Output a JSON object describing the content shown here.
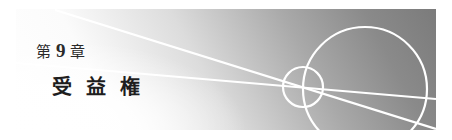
{
  "chapter": {
    "prefix": "第",
    "number": "9",
    "suffix": "章",
    "title": "受益権"
  },
  "banner": {
    "gradient_light": "#ffffff",
    "gradient_dark": "#7b7b7b",
    "line_color": "#ffffff",
    "decoration": {
      "small_circle": {
        "cx": 287,
        "cy": 78,
        "r": 20
      },
      "large_circle": {
        "cx": 349,
        "cy": 80,
        "r": 62
      },
      "lines": [
        {
          "x1": 39,
          "y1": 1,
          "x2": 420,
          "y2": 120
        },
        {
          "x1": 0,
          "y1": 54,
          "x2": 420,
          "y2": 90
        }
      ]
    }
  }
}
